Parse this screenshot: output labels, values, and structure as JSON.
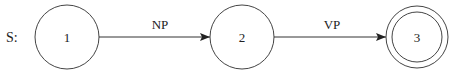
{
  "diagram": {
    "start_label": "S:",
    "nodes": [
      {
        "id": "1",
        "label": "1",
        "accepting": false
      },
      {
        "id": "2",
        "label": "2",
        "accepting": false
      },
      {
        "id": "3",
        "label": "3",
        "accepting": true
      }
    ],
    "edges": [
      {
        "from": "1",
        "to": "2",
        "label": "NP"
      },
      {
        "from": "2",
        "to": "3",
        "label": "VP"
      }
    ]
  }
}
